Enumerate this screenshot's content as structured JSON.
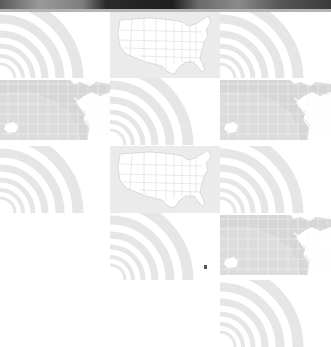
{
  "banner": {
    "type": "photo-strip",
    "bar_color": "#b4b4b4"
  },
  "grid": {
    "columns": [
      0,
      110,
      220
    ],
    "tile_width": 111,
    "rows": [
      12,
      78,
      146,
      213,
      280
    ],
    "tile_height": 67,
    "tiles": [
      {
        "row": 0,
        "col": 0,
        "kind": "signal"
      },
      {
        "row": 0,
        "col": 1,
        "kind": "map-us"
      },
      {
        "row": 0,
        "col": 2,
        "kind": "signal"
      },
      {
        "row": 1,
        "col": 0,
        "kind": "map-world"
      },
      {
        "row": 1,
        "col": 1,
        "kind": "signal"
      },
      {
        "row": 1,
        "col": 2,
        "kind": "map-world"
      },
      {
        "row": 2,
        "col": 0,
        "kind": "signal"
      },
      {
        "row": 2,
        "col": 1,
        "kind": "map-us"
      },
      {
        "row": 2,
        "col": 2,
        "kind": "signal"
      },
      {
        "row": 3,
        "col": 1,
        "kind": "signal"
      },
      {
        "row": 3,
        "col": 2,
        "kind": "map-world"
      },
      {
        "row": 4,
        "col": 2,
        "kind": "signal"
      }
    ]
  },
  "colors": {
    "signal_arc": "#e6e6e6",
    "map_land": "#d6d6d6",
    "map_grid": "#f4f4f4",
    "us_map_fill": "#ffffff",
    "us_map_bg": "#ebebeb",
    "us_map_border": "#c8c8c8"
  },
  "cursor": {
    "x": 204,
    "y": 265
  }
}
